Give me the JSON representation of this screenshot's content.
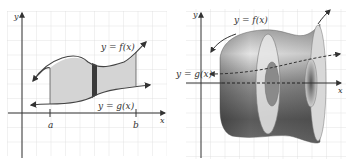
{
  "left_panel": {
    "y_axis_label": "y",
    "x_axis_label": "x",
    "f_label": "y = f(x)",
    "g_label": "y = g(x)",
    "a_label": "a",
    "b_label": "b",
    "colors": {
      "grid": "#d8d8d8",
      "region_fill": "#d4d4d4",
      "strip_fill": "#3a3a3a",
      "curve": "#444444"
    }
  },
  "right_panel": {
    "y_axis_label": "y",
    "x_axis_label": "x",
    "f_label": "y = f(x)",
    "g_label": "y = g(x)",
    "colors": {
      "grid": "#d8d8d8",
      "solid_dark": "#555555",
      "solid_light": "#d0d0d0"
    }
  }
}
